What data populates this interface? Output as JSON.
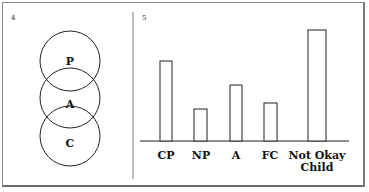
{
  "panels": [
    {
      "number": "4",
      "type": "stacked-circles",
      "circles": [
        {
          "label": "P",
          "name": "Parent"
        },
        {
          "label": "A",
          "name": "Adult"
        },
        {
          "label": "C",
          "name": "Child"
        }
      ]
    },
    {
      "number": "5",
      "type": "bar"
    }
  ],
  "chart_data": {
    "type": "bar",
    "title": "",
    "xlabel": "",
    "ylabel": "",
    "categories": [
      "CP",
      "NP",
      "A",
      "FC",
      "Not Okay Child"
    ],
    "category_lines": [
      [
        "CP"
      ],
      [
        "NP"
      ],
      [
        "A"
      ],
      [
        "FC"
      ],
      [
        "Not Okay",
        "Child"
      ]
    ],
    "values": [
      80,
      32,
      56,
      38,
      111
    ],
    "value_units": "relative bar height (px, unlabeled axis)",
    "ylim": [
      0,
      120
    ],
    "grid": false,
    "legend": null
  },
  "colors": {
    "stroke": "#222222",
    "frame": "#8a8a8a",
    "background": "#ffffff"
  }
}
